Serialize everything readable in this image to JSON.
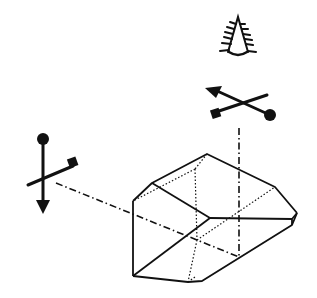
{
  "diagram": {
    "colors": {
      "ink": "#111111",
      "background": "#ffffff"
    },
    "elements": [
      {
        "name": "eye-symbol",
        "label": "observer eye"
      },
      {
        "name": "orientation-marker-top",
        "label": "top orientation marker (arrow, square, circle)"
      },
      {
        "name": "orientation-marker-left",
        "label": "left orientation marker (arrow, square, circle)"
      },
      {
        "name": "prism",
        "label": "prism with hidden edges dotted"
      },
      {
        "name": "optical-axis-horizontal",
        "label": "dash-dot ray from left marker into prism"
      },
      {
        "name": "optical-axis-vertical",
        "label": "dash-dot ray from top marker down into prism"
      }
    ]
  }
}
